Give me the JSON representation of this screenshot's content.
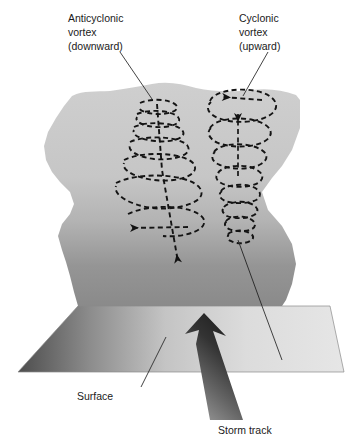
{
  "figure": {
    "background_color": "#ffffff"
  },
  "labels": {
    "anticyclonic": {
      "line1": "Anticyclonic",
      "line2": "vortex",
      "line3": "(downward)"
    },
    "cyclonic": {
      "line1": "Cyclonic",
      "line2": "vortex",
      "line3": "(upward)"
    },
    "surface": "Surface",
    "storm_track": "Storm track"
  },
  "elements": {
    "cloud_slab_name": "cloud-slab",
    "surface_plane_name": "surface-plane",
    "storm_track_arrow_name": "storm-track-arrow",
    "anticyclonic_helix_name": "anticyclonic-helix",
    "cyclonic_helix_name": "cyclonic-helix"
  },
  "colors": {
    "slab_top": "#c9c9c9",
    "slab_bottom": "#8e8e8e",
    "surface_dark": "#4a4a4a",
    "surface_light": "#e2e2e2",
    "arrow_dark": "#2b2b2b",
    "arrow_light": "#a8a8a8",
    "dash_line": "#1a1a1a",
    "leader_line": "#3a3a3a",
    "text": "#1a1a1a"
  },
  "geometry": {
    "width": 357,
    "height": 443,
    "anticyclonic_axis_x": 160,
    "cyclonic_axis_x": 240,
    "slab_top_y": 88,
    "slab_bottom_y": 305,
    "surface_top_y": 305,
    "surface_bottom_y": 372
  }
}
